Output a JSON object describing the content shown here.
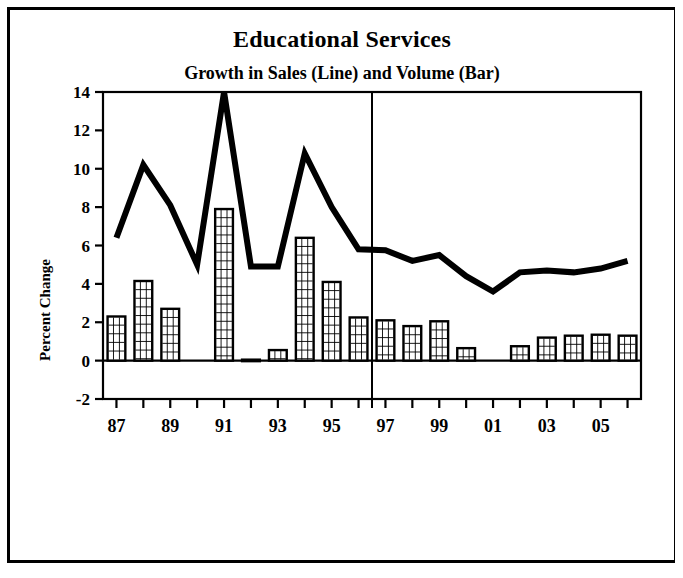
{
  "title": "Educational Services",
  "subtitle": "Growth in Sales (Line) and Volume (Bar)",
  "axis": {
    "ylabel": "Percent Change",
    "y_ticks": [
      "-2",
      "0",
      "2",
      "4",
      "6",
      "8",
      "10",
      "12",
      "14"
    ],
    "x_ticks_labeled": [
      "87",
      "89",
      "91",
      "93",
      "95",
      "97",
      "99",
      "01",
      "03",
      "05"
    ]
  },
  "colors": {
    "ink": "#000000",
    "background": "#ffffff",
    "bar_fill": "#ffffff",
    "line": "#000000"
  },
  "chart_data": {
    "type": "bar",
    "title": "Educational Services",
    "subtitle": "Growth in Sales (Line) and Volume (Bar)",
    "xlabel": "",
    "ylabel": "Percent Change",
    "ylim": [
      -2,
      14
    ],
    "y_ticks": [
      -2,
      0,
      2,
      4,
      6,
      8,
      10,
      12,
      14
    ],
    "grid": false,
    "legend": "none",
    "categories": [
      "87",
      "88",
      "89",
      "90",
      "91",
      "92",
      "93",
      "94",
      "95",
      "96",
      "97",
      "98",
      "99",
      "00",
      "01",
      "02",
      "03",
      "04",
      "05",
      "06"
    ],
    "x_tick_labels": [
      "87",
      "",
      "89",
      "",
      "91",
      "",
      "93",
      "",
      "95",
      "",
      "97",
      "",
      "99",
      "",
      "01",
      "",
      "03",
      "",
      "05",
      ""
    ],
    "series": [
      {
        "name": "Volume (Bar)",
        "type": "bar",
        "values": [
          2.3,
          4.15,
          2.7,
          0.0,
          7.9,
          0.05,
          0.55,
          6.4,
          4.1,
          2.25,
          2.1,
          1.8,
          2.05,
          0.65,
          0.0,
          0.75,
          1.2,
          1.3,
          1.35,
          1.3
        ]
      },
      {
        "name": "Sales (Line)",
        "type": "line",
        "values": [
          6.4,
          10.2,
          8.1,
          5.0,
          14.0,
          4.9,
          4.9,
          10.8,
          8.0,
          5.8,
          5.75,
          5.2,
          5.5,
          4.4,
          3.6,
          4.6,
          4.7,
          4.6,
          4.8,
          5.2
        ]
      }
    ],
    "annotations": [
      {
        "type": "vertical-divider",
        "between": [
          "96",
          "97"
        ]
      }
    ]
  }
}
